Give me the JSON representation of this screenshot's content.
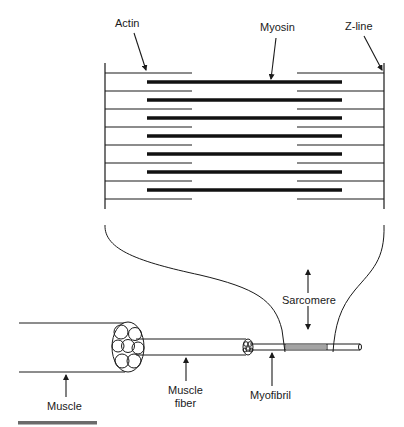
{
  "figure": {
    "labels": {
      "actin": "Actin",
      "myosin": "Myosin",
      "z_line": "Z-line",
      "sarcomere": "Sarcomere",
      "muscle": "Muscle",
      "muscle_fiber_line1": "Muscle",
      "muscle_fiber_line2": "fiber",
      "myofibril": "Myofibril"
    },
    "colors": {
      "ink": "#1a1a1a",
      "scale_bar": "#6b6b6b"
    },
    "sarcomere_detail": {
      "thin_filament_rows": 8,
      "thick_filament_rows": 7
    }
  }
}
